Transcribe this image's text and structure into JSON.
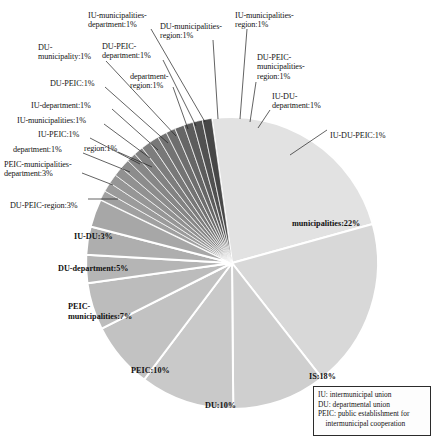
{
  "chart_data": {
    "type": "pie",
    "title": "",
    "total_label_suffix": "%",
    "legend_position": "bottom-right",
    "center": {
      "x": 232,
      "y": 263
    },
    "radius": 146,
    "start_angle_deg": -8,
    "categories": [
      "municipalities",
      "IS",
      "DU",
      "PEIC",
      "PEIC-municipalities",
      "DU-department",
      "IU-DU",
      "DU-PEIC-region",
      "PEIC-municipalities-department",
      "region",
      "IU-PEIC",
      "IU-municipalities",
      "IU-department",
      "DU-PEIC",
      "DU-municipality",
      "IU-municipalities-department",
      "department-region",
      "DU-PEIC-department",
      "DU-municipalities-region",
      "IU-municipalities-region",
      "DU-PEIC-municipalities-region",
      "IU-DU-department",
      "IU-DU-PEIC",
      "department"
    ],
    "values": [
      22,
      18,
      10,
      10,
      7,
      5,
      3,
      3,
      3,
      1,
      1,
      1,
      1,
      1,
      1,
      1,
      1,
      1,
      1,
      1,
      1,
      1,
      1,
      1
    ],
    "slices": [
      {
        "label": "municipalities",
        "value": 22,
        "display": "municipalities:22%",
        "color": "#e2e2e2"
      },
      {
        "label": "IS",
        "value": 18,
        "display": "IS:18%",
        "color": "#d8d8d8"
      },
      {
        "label": "DU",
        "value": 10,
        "display": "DU:10%",
        "color": "#cfcfcf"
      },
      {
        "label": "PEIC",
        "value": 10,
        "display": "PEIC:10%",
        "color": "#c9c9c9"
      },
      {
        "label": "PEIC-municipalities",
        "value": 7,
        "display": "PEIC-\nmunicipalities:7%",
        "color": "#c2c2c2"
      },
      {
        "label": "DU-department",
        "value": 5,
        "display": "DU-department:5%",
        "color": "#bcbcbc"
      },
      {
        "label": "IU-DU",
        "value": 3,
        "display": "IU-DU:3%",
        "color": "#b5b5b5"
      },
      {
        "label": "DU-PEIC-region",
        "value": 3,
        "display": "DU-PEIC-region:3%",
        "color": "#aeaeae"
      },
      {
        "label": "PEIC-municipalities-department",
        "value": 3,
        "display": "PEIC-municipalities-\ndepartment:3%",
        "color": "#a7a7a7"
      },
      {
        "label": "department",
        "value": 1,
        "display": "department:1%",
        "color": "#a0a0a0"
      },
      {
        "label": "region",
        "value": 1,
        "display": "region:1%",
        "color": "#9b9b9b"
      },
      {
        "label": "IU-PEIC",
        "value": 1,
        "display": "IU-PEIC:1%",
        "color": "#969696"
      },
      {
        "label": "IU-municipalities",
        "value": 1,
        "display": "IU-municipalities:1%",
        "color": "#919191"
      },
      {
        "label": "IU-department",
        "value": 1,
        "display": "IU-department:1%",
        "color": "#8c8c8c"
      },
      {
        "label": "DU-PEIC",
        "value": 1,
        "display": "DU-PEIC:1%",
        "color": "#878787"
      },
      {
        "label": "DU-municipality",
        "value": 1,
        "display": "DU-\nmunicipality:1%",
        "color": "#828282"
      },
      {
        "label": "department-region",
        "value": 1,
        "display": "department-\nregion:1%",
        "color": "#7d7d7d"
      },
      {
        "label": "IU-municipalities-department",
        "value": 1,
        "display": "IU-municipalities-\ndepartment:1%",
        "color": "#787878"
      },
      {
        "label": "DU-PEIC-department",
        "value": 1,
        "display": "DU-PEIC-\ndepartment:1%",
        "color": "#737373"
      },
      {
        "label": "DU-municipalities-region",
        "value": 1,
        "display": "DU-municipalities-\nregion:1%",
        "color": "#6e6e6e"
      },
      {
        "label": "IU-municipalities-region",
        "value": 1,
        "display": "IU-municipalities-\nregion:1%",
        "color": "#666666"
      },
      {
        "label": "DU-PEIC-municipalities-region",
        "value": 1,
        "display": "DU-PEIC-\nmunicipalities-\nregion:1%",
        "color": "#5c5c5c"
      },
      {
        "label": "IU-DU-department",
        "value": 1,
        "display": "IU-DU-\ndepartment:1%",
        "color": "#515151"
      },
      {
        "label": "IU-DU-PEIC",
        "value": 1,
        "display": "IU-DU-PEIC:1%",
        "color": "#474747"
      }
    ]
  },
  "inside_labels": [
    {
      "key": "municipalities",
      "text": "municipalities:22%",
      "x": 292,
      "y": 219
    },
    {
      "key": "is",
      "text": "IS:18%",
      "x": 309,
      "y": 372
    },
    {
      "key": "du",
      "text": "DU:10%",
      "x": 205,
      "y": 401
    },
    {
      "key": "peic",
      "text": "PEIC:10%",
      "x": 131,
      "y": 366
    },
    {
      "key": "peic-municipalities",
      "text": "PEIC-\nmunicipalities:7%",
      "x": 68,
      "y": 302
    },
    {
      "key": "du-department",
      "text": "DU-department:5%",
      "x": 58,
      "y": 264
    },
    {
      "key": "iu-du",
      "text": "IU-DU:3%",
      "x": 74,
      "y": 232
    }
  ],
  "outside_labels": [
    {
      "key": "du-peic-region",
      "text": "DU-PEIC-region:3%",
      "x": 10,
      "y": 201,
      "align": "l"
    },
    {
      "key": "peic-municipalities-department",
      "text": "PEIC-municipalities-\ndepartment:3%",
      "x": 4,
      "y": 160,
      "align": "l"
    },
    {
      "key": "region",
      "text": "region:1%",
      "x": 84,
      "y": 144,
      "align": "l"
    },
    {
      "key": "department",
      "text": "department:1%",
      "x": 13,
      "y": 145,
      "align": "l"
    },
    {
      "key": "iu-peic",
      "text": "IU-PEIC:1%",
      "x": 38,
      "y": 130,
      "align": "l"
    },
    {
      "key": "iu-municipalities",
      "text": "IU-municipalities:1%",
      "x": 17,
      "y": 116,
      "align": "l"
    },
    {
      "key": "iu-department",
      "text": "IU-department:1%",
      "x": 31,
      "y": 101,
      "align": "l"
    },
    {
      "key": "du-peic",
      "text": "DU-PEIC:1%",
      "x": 50,
      "y": 79,
      "align": "l"
    },
    {
      "key": "du-municipality",
      "text": "DU-\nmunicipality:1%",
      "x": 38,
      "y": 43,
      "align": "l"
    },
    {
      "key": "department-region",
      "text": "department-\nregion:1%",
      "x": 130,
      "y": 72,
      "align": "l"
    },
    {
      "key": "du-peic-department",
      "text": "DU-PEIC-\ndepartment:1%",
      "x": 102,
      "y": 42,
      "align": "l"
    },
    {
      "key": "iu-municipalities-department",
      "text": "IU-municipalities-\ndepartment:1%",
      "x": 88,
      "y": 11,
      "align": "l"
    },
    {
      "key": "du-municipalities-region",
      "text": "DU-municipalities-\nregion:1%",
      "x": 160,
      "y": 22,
      "align": "l"
    },
    {
      "key": "iu-municipalities-region",
      "text": "IU-municipalities-\nregion:1%",
      "x": 235,
      "y": 11,
      "align": "l"
    },
    {
      "key": "du-peic-municipalities-region",
      "text": "DU-PEIC-\nmunicipalities-\nregion:1%",
      "x": 257,
      "y": 53,
      "align": "l"
    },
    {
      "key": "iu-du-department",
      "text": "IU-DU-\ndepartment:1%",
      "x": 272,
      "y": 92,
      "align": "l"
    },
    {
      "key": "iu-du-peic",
      "text": "IU-DU-PEIC:1%",
      "x": 330,
      "y": 131,
      "align": "l"
    }
  ],
  "leader_lines": [
    {
      "key": "du-peic-region",
      "x1": 88,
      "y1": 199,
      "x2": 118,
      "y2": 199
    },
    {
      "key": "peic-municipalities-department",
      "x1": 82,
      "y1": 173,
      "x2": 113,
      "y2": 185
    },
    {
      "key": "region",
      "x1": 118,
      "y1": 152,
      "x2": 152,
      "y2": 167
    },
    {
      "key": "department",
      "x1": 83,
      "y1": 153,
      "x2": 130,
      "y2": 172
    },
    {
      "key": "iu-peic",
      "x1": 90,
      "y1": 138,
      "x2": 140,
      "y2": 164
    },
    {
      "key": "iu-municipalities",
      "x1": 104,
      "y1": 124,
      "x2": 150,
      "y2": 158
    },
    {
      "key": "iu-department",
      "x1": 112,
      "y1": 109,
      "x2": 158,
      "y2": 150
    },
    {
      "key": "du-peic",
      "x1": 105,
      "y1": 87,
      "x2": 168,
      "y2": 143
    },
    {
      "key": "du-municipality",
      "x1": 106,
      "y1": 61,
      "x2": 176,
      "y2": 136
    },
    {
      "key": "department-region",
      "x1": 173,
      "y1": 87,
      "x2": 188,
      "y2": 129
    },
    {
      "key": "du-peic-department",
      "x1": 163,
      "y1": 60,
      "x2": 196,
      "y2": 126
    },
    {
      "key": "iu-municipalities-department",
      "x1": 151,
      "y1": 29,
      "x2": 205,
      "y2": 122
    },
    {
      "key": "du-municipalities-region",
      "x1": 213,
      "y1": 40,
      "x2": 218,
      "y2": 119
    },
    {
      "key": "iu-municipalities-region",
      "x1": 247,
      "y1": 29,
      "x2": 240,
      "y2": 119
    },
    {
      "key": "du-peic-municipalities-region",
      "x1": 256,
      "y1": 82,
      "x2": 250,
      "y2": 122
    },
    {
      "key": "iu-du-department",
      "x1": 270,
      "y1": 110,
      "x2": 258,
      "y2": 128
    },
    {
      "key": "iu-du-peic",
      "x1": 327,
      "y1": 130,
      "x2": 290,
      "y2": 155
    }
  ],
  "legend": {
    "lines": [
      "IU: intermunicipal union",
      "DU: departmental union",
      "PEIC: public establishment for",
      "    intermunicipal cooperation"
    ]
  }
}
